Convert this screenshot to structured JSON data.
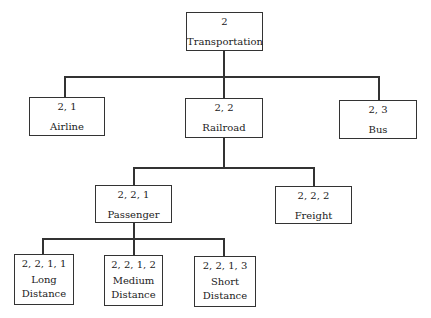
{
  "diagram": {
    "type": "hierarchy-tree",
    "root": {
      "id": "2",
      "label": "Transportation"
    },
    "level1": [
      {
        "id": "2, 1",
        "label": "Airline"
      },
      {
        "id": "2, 2",
        "label": "Railroad"
      },
      {
        "id": "2, 3",
        "label": "Bus"
      }
    ],
    "level2": [
      {
        "id": "2, 2, 1",
        "label": "Passenger"
      },
      {
        "id": "2, 2, 2",
        "label": "Freight"
      }
    ],
    "level3": [
      {
        "id": "2, 2, 1, 1",
        "label_line1": "Long",
        "label_line2": "Distance"
      },
      {
        "id": "2, 2, 1, 2",
        "label_line1": "Medium",
        "label_line2": "Distance"
      },
      {
        "id": "2, 2, 1, 3",
        "label_line1": "Short",
        "label_line2": "Distance"
      }
    ]
  }
}
